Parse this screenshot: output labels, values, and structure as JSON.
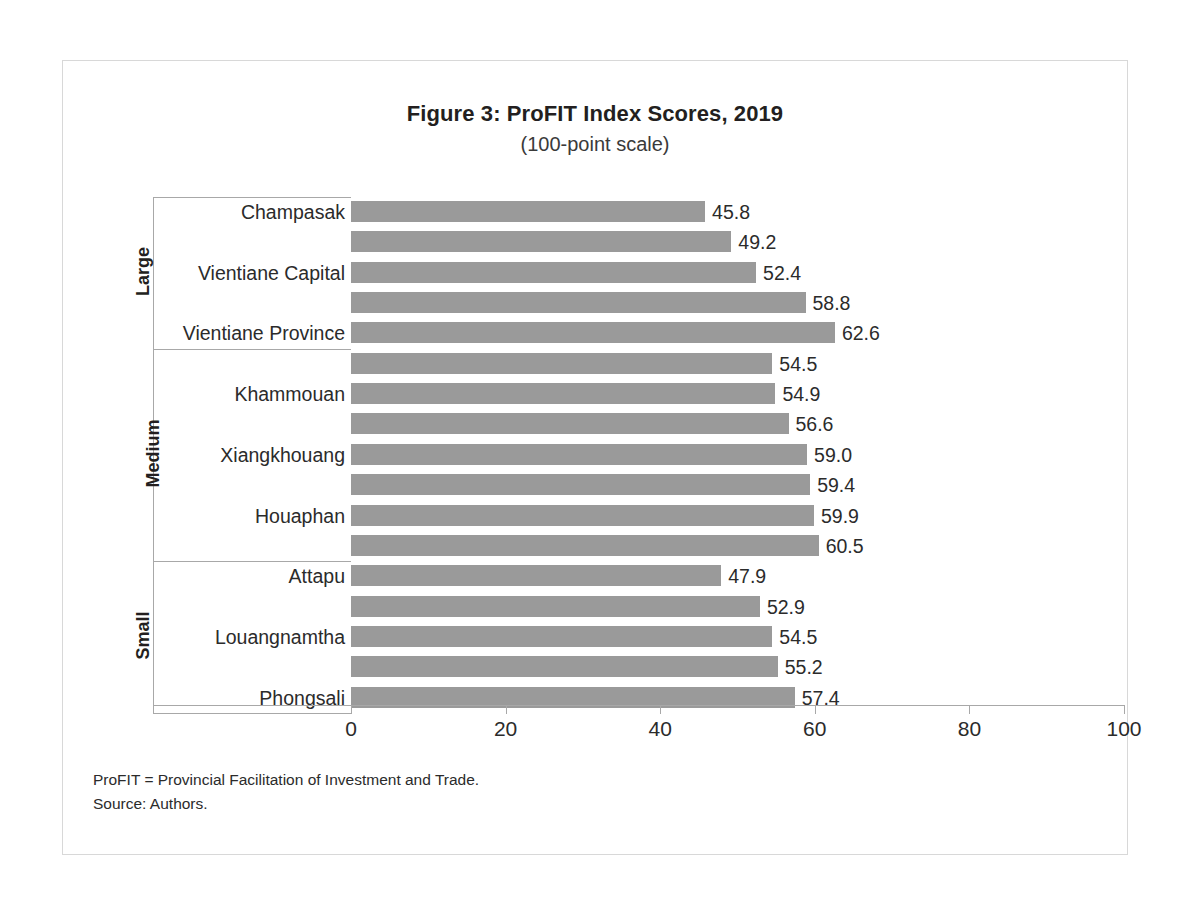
{
  "chart_data": {
    "type": "bar",
    "orientation": "horizontal",
    "title": "Figure 3: ProFIT Index Scores, 2019",
    "subtitle": "(100-point scale)",
    "xlabel": "",
    "ylabel": "",
    "xlim": [
      0,
      100
    ],
    "xticks": [
      "0",
      "20",
      "40",
      "60",
      "80",
      "100"
    ],
    "grid": false,
    "legend": null,
    "bar_color": "#9a9a9a",
    "groups": [
      {
        "name": "Large",
        "bars": [
          {
            "label": "Champasak",
            "value": 45.8,
            "value_text": "45.8",
            "show_label": true
          },
          {
            "label": "",
            "value": 49.2,
            "value_text": "49.2",
            "show_label": false
          },
          {
            "label": "Vientiane Capital",
            "value": 52.4,
            "value_text": "52.4",
            "show_label": true
          },
          {
            "label": "",
            "value": 58.8,
            "value_text": "58.8",
            "show_label": false
          },
          {
            "label": "Vientiane Province",
            "value": 62.6,
            "value_text": "62.6",
            "show_label": true
          }
        ]
      },
      {
        "name": "Medium",
        "bars": [
          {
            "label": "",
            "value": 54.5,
            "value_text": "54.5",
            "show_label": false
          },
          {
            "label": "Khammouan",
            "value": 54.9,
            "value_text": "54.9",
            "show_label": true
          },
          {
            "label": "",
            "value": 56.6,
            "value_text": "56.6",
            "show_label": false
          },
          {
            "label": "Xiangkhouang",
            "value": 59.0,
            "value_text": "59.0",
            "show_label": true
          },
          {
            "label": "",
            "value": 59.4,
            "value_text": "59.4",
            "show_label": false
          },
          {
            "label": "Houaphan",
            "value": 59.9,
            "value_text": "59.9",
            "show_label": true
          },
          {
            "label": "",
            "value": 60.5,
            "value_text": "60.5",
            "show_label": false
          }
        ]
      },
      {
        "name": "Small",
        "bars": [
          {
            "label": "Attapu",
            "value": 47.9,
            "value_text": "47.9",
            "show_label": true
          },
          {
            "label": "",
            "value": 52.9,
            "value_text": "52.9",
            "show_label": false
          },
          {
            "label": "Louangnamtha",
            "value": 54.5,
            "value_text": "54.5",
            "show_label": true
          },
          {
            "label": "",
            "value": 55.2,
            "value_text": "55.2",
            "show_label": false
          },
          {
            "label": "Phongsali",
            "value": 57.4,
            "value_text": "57.4",
            "show_label": true
          }
        ]
      }
    ]
  },
  "footnotes": [
    "ProFIT = Provincial Facilitation of Investment and Trade.",
    "Source: Authors."
  ]
}
